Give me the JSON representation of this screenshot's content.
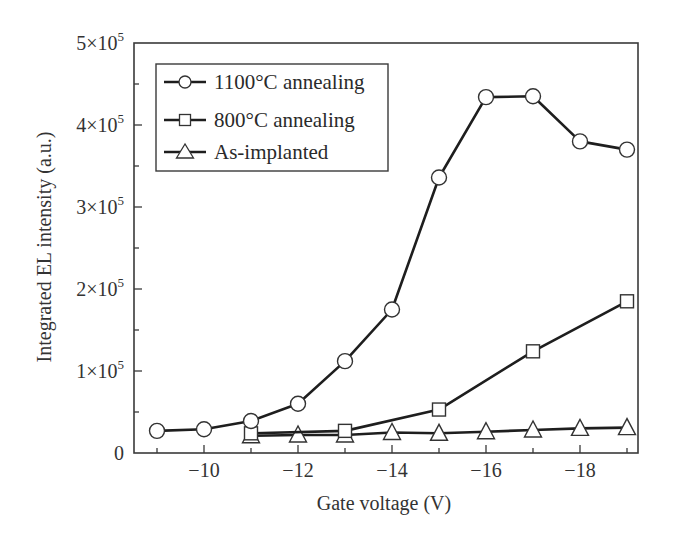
{
  "chart_data": {
    "type": "line",
    "title": "",
    "xlabel": "Gate voltage (V)",
    "ylabel": "Integrated EL intensity (a.u.)",
    "xlim": [
      -8.5,
      -19.25
    ],
    "ylim": [
      0,
      500000
    ],
    "x_ticks": [
      -9,
      -10,
      -11,
      -12,
      -13,
      -14,
      -15,
      -16,
      -17,
      -18,
      -19
    ],
    "x_tick_labels": [
      {
        "value": -10,
        "label": "−10"
      },
      {
        "value": -12,
        "label": "−12"
      },
      {
        "value": -14,
        "label": "−14"
      },
      {
        "value": -16,
        "label": "−16"
      },
      {
        "value": -18,
        "label": "−18"
      }
    ],
    "y_ticks": [
      0,
      50000,
      100000,
      150000,
      200000,
      250000,
      300000,
      350000,
      400000,
      450000,
      500000
    ],
    "y_tick_labels": [
      {
        "value": 0,
        "label": "0",
        "mant": "0",
        "exp": ""
      },
      {
        "value": 100000,
        "label": "1×10^5",
        "mant": "1×10",
        "exp": "5"
      },
      {
        "value": 200000,
        "label": "2×10^5",
        "mant": "2×10",
        "exp": "5"
      },
      {
        "value": 300000,
        "label": "3×10^5",
        "mant": "3×10",
        "exp": "5"
      },
      {
        "value": 400000,
        "label": "4×10^5",
        "mant": "4×10",
        "exp": "5"
      },
      {
        "value": 500000,
        "label": "5×10^5",
        "mant": "5×10",
        "exp": "5"
      }
    ],
    "grid": false,
    "legend_position": "upper left (inside)",
    "series": [
      {
        "name": "1100°C annealing",
        "marker": "circle",
        "x": [
          -9,
          -10,
          -11,
          -12,
          -13,
          -14,
          -15,
          -16,
          -17,
          -18,
          -19
        ],
        "values": [
          27000,
          29000,
          39000,
          60000,
          112000,
          175000,
          336000,
          434000,
          435000,
          380000,
          370000
        ]
      },
      {
        "name": "800°C annealing",
        "marker": "square",
        "x": [
          -11,
          -13,
          -15,
          -17,
          -19
        ],
        "values": [
          24000,
          27000,
          53000,
          124000,
          185000
        ]
      },
      {
        "name": "As-implanted",
        "marker": "triangle",
        "x": [
          -11,
          -12,
          -13,
          -14,
          -15,
          -16,
          -17,
          -18,
          -19
        ],
        "values": [
          21000,
          22000,
          22000,
          25000,
          24000,
          26000,
          28000,
          30000,
          31000
        ]
      }
    ]
  },
  "legend": {
    "items": [
      {
        "label": "1100°C annealing",
        "marker": "circle"
      },
      {
        "label": "800°C annealing",
        "marker": "square"
      },
      {
        "label": "As-implanted",
        "marker": "triangle"
      }
    ]
  },
  "colors": {
    "line": "#1e1e1e",
    "frame": "#3a3a3a",
    "marker_fill": "#ffffff"
  }
}
